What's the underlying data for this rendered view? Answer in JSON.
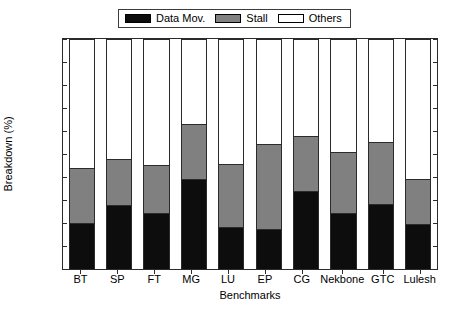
{
  "chart_data": {
    "type": "bar",
    "subtype": "stacked-vertical",
    "title": "",
    "xlabel": "Benchmarks",
    "ylabel": "Breakdown (%)",
    "ylim": [
      0,
      100
    ],
    "ytick_step": 10,
    "yticks": [
      0,
      10,
      20,
      30,
      40,
      50,
      60,
      70,
      80,
      90,
      100
    ],
    "grid": false,
    "legend_position": "top-center",
    "categories": [
      "BT",
      "SP",
      "FT",
      "MG",
      "LU",
      "EP",
      "CG",
      "Nekbone",
      "GTC",
      "Lulesh"
    ],
    "series": [
      {
        "name": "Data Mov.",
        "color": "#0d0d0d",
        "values": [
          20,
          28,
          24.5,
          39.5,
          18.5,
          17.5,
          34,
          24.5,
          28.5,
          19.5
        ]
      },
      {
        "name": "Stall",
        "color": "#808080",
        "values": [
          24,
          20,
          21,
          24,
          27.5,
          37,
          24,
          26.5,
          27,
          20
        ]
      },
      {
        "name": "Others",
        "color": "#ffffff",
        "values": [
          56,
          52,
          54.5,
          36.5,
          54,
          45.5,
          42,
          49,
          44.5,
          60.5
        ]
      }
    ],
    "cumulative_tops": {
      "data_mov": [
        20,
        28,
        24.5,
        39.5,
        18.5,
        17.5,
        34,
        24.5,
        28.5,
        19.5
      ],
      "stall": [
        44,
        48,
        45.5,
        63.5,
        46,
        54.5,
        58,
        51,
        55.5,
        39.5
      ],
      "others": [
        100,
        100,
        100,
        100,
        100,
        100,
        100,
        100,
        100,
        100
      ]
    }
  },
  "legend": {
    "entries": [
      {
        "label": "Data Mov.",
        "swatch": "#0d0d0d"
      },
      {
        "label": "Stall",
        "swatch": "#808080"
      },
      {
        "label": "Others",
        "swatch": "#ffffff"
      }
    ]
  },
  "axes": {
    "y_label": "Breakdown (%)",
    "x_label": "Benchmarks",
    "y_ticks": [
      "100",
      "90",
      "80",
      "70",
      "60",
      "50",
      "40",
      "30",
      "20",
      "10",
      "0"
    ],
    "x_ticks": [
      "BT",
      "SP",
      "FT",
      "MG",
      "LU",
      "EP",
      "CG",
      "Nekbone",
      "GTC",
      "Lulesh"
    ]
  },
  "colors": {
    "data_mov": "#0d0d0d",
    "stall": "#808080",
    "others": "#ffffff",
    "axis": "#2b2b2b",
    "background": "#ffffff"
  }
}
